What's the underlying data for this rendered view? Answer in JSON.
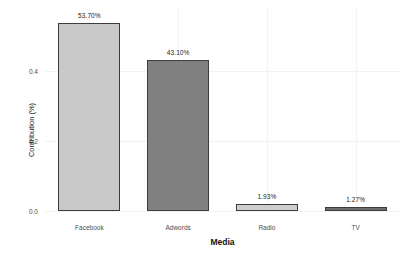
{
  "chart_data": {
    "type": "bar",
    "title": "",
    "xlabel": "Media",
    "ylabel": "Contribution (%)",
    "categories": [
      "Facebook",
      "Adwords",
      "Radio",
      "TV"
    ],
    "values": [
      0.537,
      0.431,
      0.0193,
      0.0127
    ],
    "data_labels": [
      "53.70%",
      "43.10%",
      "1.93%",
      "1.27%"
    ],
    "bar_colors": [
      "#c9c9c9",
      "#808080",
      "#cdcdcd",
      "#6e6e6e"
    ],
    "bar_border_color": "#3d3d3d",
    "ylim": [
      0,
      0.58
    ],
    "yticks": [
      0.0,
      0.2,
      0.4
    ],
    "ytick_labels": [
      "0.0",
      "0.2",
      "0.4"
    ],
    "grid": true,
    "grid_color": "#f2f2f2",
    "legend": "none",
    "background": "#ffffff"
  }
}
